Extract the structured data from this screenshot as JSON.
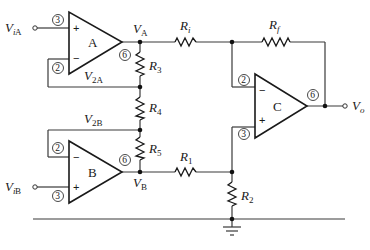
{
  "diagram": {
    "type": "instrumentation-amplifier-circuit",
    "opamps": [
      {
        "id": "A",
        "label": "A",
        "pins": {
          "noninv": "3",
          "inv": "2",
          "out": "6"
        },
        "noninv_sign": "+",
        "inv_sign": "−"
      },
      {
        "id": "B",
        "label": "B",
        "pins": {
          "noninv": "3",
          "inv": "2",
          "out": "6"
        },
        "noninv_sign": "+",
        "inv_sign": "−"
      },
      {
        "id": "C",
        "label": "C",
        "pins": {
          "noninv": "3",
          "inv": "2",
          "out": "6"
        },
        "noninv_sign": "+",
        "inv_sign": "−"
      }
    ],
    "resistors": [
      {
        "id": "Ri",
        "main": "R",
        "sub": "i"
      },
      {
        "id": "Rf",
        "main": "R",
        "sub": "f"
      },
      {
        "id": "R1",
        "main": "R",
        "sub": "1"
      },
      {
        "id": "R2",
        "main": "R",
        "sub": "2"
      },
      {
        "id": "R3",
        "main": "R",
        "sub": "3"
      },
      {
        "id": "R4",
        "main": "R",
        "sub": "4"
      },
      {
        "id": "R5",
        "main": "R",
        "sub": "5"
      }
    ],
    "node_labels": {
      "ViA": {
        "main": "V",
        "sub_i": "i",
        "sub": " A"
      },
      "ViB": {
        "main": "V",
        "sub_i": "i",
        "sub": " B"
      },
      "VA": {
        "main": "V",
        "sub": "A"
      },
      "VB": {
        "main": "V",
        "sub": "B"
      },
      "V2A": {
        "main": "V",
        "sub": "2A"
      },
      "V2B": {
        "main": "V",
        "sub": "2B"
      },
      "Vo": {
        "main": "V",
        "sub_i": "o"
      }
    },
    "ground": "ground-symbol"
  }
}
